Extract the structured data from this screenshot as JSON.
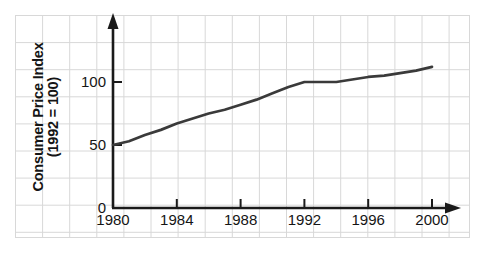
{
  "chart_data": {
    "type": "line",
    "title": "",
    "subtitle": "",
    "xlabel": "",
    "ylabel": "Consumer Price Index (1992 = 100)",
    "ylabel_line1": "Consumer Price Index",
    "ylabel_line2": "(1992 = 100)",
    "xlim": [
      1980,
      2001.5
    ],
    "ylim": [
      0,
      125
    ],
    "yticks": [
      0,
      50,
      100
    ],
    "ytick_labels": [
      "0",
      "50",
      "100"
    ],
    "xticks": [
      1980,
      1984,
      1988,
      1992,
      1996,
      2000
    ],
    "xtick_labels": [
      "1980",
      "1984",
      "1988",
      "1992",
      "1996",
      "2000"
    ],
    "grid": "light-gray background grid over entire figure",
    "legend": "none",
    "legend_position": "none",
    "series": [
      {
        "name": "Consumer Price Index",
        "color": "#3a3a3a",
        "x": [
          1980,
          1981,
          1982,
          1983,
          1984,
          1985,
          1986,
          1987,
          1988,
          1989,
          1990,
          1991,
          1992,
          1993,
          1994,
          1995,
          1996,
          1997,
          1998,
          1999,
          2000
        ],
        "values": [
          50,
          53,
          58,
          62,
          67,
          71,
          75,
          78,
          82,
          86,
          91,
          96,
          100,
          100,
          100,
          102,
          104,
          105,
          107,
          109,
          112
        ]
      }
    ],
    "annotations": [],
    "axis_style": {
      "y_axis_arrow": true,
      "x_axis_arrow": true,
      "axis_color": "#1a1a1a"
    }
  },
  "colors": {
    "line": "#3a3a3a",
    "axis": "#1a1a1a",
    "grid": "#d8d8d8",
    "text": "#151515",
    "background": "#ffffff"
  }
}
